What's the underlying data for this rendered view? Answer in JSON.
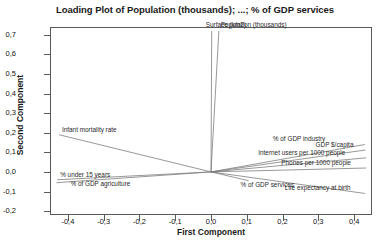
{
  "chart_data": {
    "type": "scatter",
    "title": "Loading Plot of Population (thousands); ...; % of GDP services",
    "xlabel": "First Component",
    "ylabel": "Second Component",
    "xlim": [
      -0.45,
      0.45
    ],
    "ylim": [
      -0.22,
      0.74
    ],
    "grid": false,
    "legend": null,
    "decimal_separator": ",",
    "xticks": [
      "-0,4",
      "-0,3",
      "-0,2",
      "-0,1",
      "0,0",
      "0,1",
      "0,2",
      "0,3",
      "0,4"
    ],
    "xtick_values": [
      -0.4,
      -0.3,
      -0.2,
      -0.1,
      0.0,
      0.1,
      0.2,
      0.3,
      0.4
    ],
    "yticks": [
      "-0,2",
      "-0,1",
      "0,0",
      "0,1",
      "0,2",
      "0,3",
      "0,4",
      "0,5",
      "0,6",
      "0,7"
    ],
    "ytick_values": [
      -0.2,
      -0.1,
      0.0,
      0.1,
      0.2,
      0.3,
      0.4,
      0.5,
      0.6,
      0.7
    ],
    "origin": [
      0.0,
      0.0
    ],
    "loadings": [
      {
        "name": "Surface (km2)",
        "x": 0.002,
        "y": 0.72,
        "label_dx": -6,
        "label_dy": -9
      },
      {
        "name": "Population (thousands)",
        "x": 0.022,
        "y": 0.72,
        "label_dx": 2,
        "label_dy": -9
      },
      {
        "name": "Infant mortality rate",
        "x": -0.425,
        "y": 0.19,
        "label_dx": 3,
        "label_dy": -8
      },
      {
        "name": "% under 15 years",
        "x": -0.43,
        "y": -0.04,
        "label_dx": 3,
        "label_dy": -8
      },
      {
        "name": "% of GDP agriculture",
        "x": -0.432,
        "y": -0.055,
        "label_dx": 14,
        "label_dy": -2
      },
      {
        "name": "% of GDP industry",
        "x": 0.43,
        "y": 0.14,
        "label_dx": -92,
        "label_dy": -9
      },
      {
        "name": "GDP $/capita",
        "x": 0.432,
        "y": 0.112,
        "label_dx": -50,
        "label_dy": -8
      },
      {
        "name": "Internet users per 1000 people",
        "x": 0.434,
        "y": 0.072,
        "label_dx": -108,
        "label_dy": -8
      },
      {
        "name": "Phones per 1000 people",
        "x": 0.434,
        "y": 0.02,
        "label_dx": -85,
        "label_dy": -8
      },
      {
        "name": "Life expectancy at birth",
        "x": 0.43,
        "y": -0.11,
        "label_dx": -80,
        "label_dy": -8
      },
      {
        "name": "% of GDP services",
        "x": 0.105,
        "y": -0.045,
        "label_dx": -8,
        "label_dy": 1
      }
    ]
  }
}
